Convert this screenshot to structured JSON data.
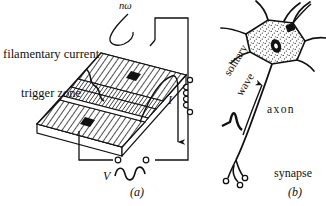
{
  "figure": {
    "panel_a": {
      "caption": "(a)",
      "labels": {
        "filamentary_current": "filamentary current",
        "trigger_zone": "trigger zone",
        "drive_frequency": "nω",
        "current": "I",
        "voltage": "V"
      }
    },
    "panel_b": {
      "caption": "(b)",
      "labels": {
        "solitary": "solitary",
        "wave": "wave",
        "axon": "axon",
        "synapse": "synapse"
      }
    },
    "colors": {
      "ink": "#111111",
      "paper": "#ffffff",
      "hatch": "#1a1a1a",
      "stipple": "#2a2a2a"
    }
  }
}
